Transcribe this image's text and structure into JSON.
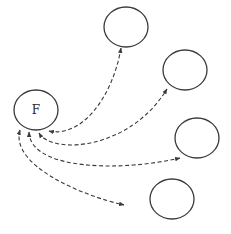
{
  "diagram": {
    "type": "hub-and-spoke",
    "hub": {
      "id": "F",
      "label": "F",
      "cx": 36,
      "cy": 110,
      "rx": 22,
      "ry": 20
    },
    "nodes": [
      {
        "id": "n1",
        "label": "",
        "cx": 126,
        "cy": 27,
        "rx": 22,
        "ry": 20
      },
      {
        "id": "n2",
        "label": "",
        "cx": 185,
        "cy": 70,
        "rx": 22,
        "ry": 20
      },
      {
        "id": "n3",
        "label": "",
        "cx": 197,
        "cy": 138,
        "rx": 22,
        "ry": 20
      },
      {
        "id": "n4",
        "label": "",
        "cx": 172,
        "cy": 199,
        "rx": 22,
        "ry": 20
      }
    ],
    "edges": [
      {
        "from": "F",
        "to": "n1",
        "style": "dashed",
        "direction": "bidirectional"
      },
      {
        "from": "F",
        "to": "n2",
        "style": "dashed",
        "direction": "bidirectional"
      },
      {
        "from": "F",
        "to": "n3",
        "style": "dashed",
        "direction": "bidirectional"
      },
      {
        "from": "F",
        "to": "n4",
        "style": "dashed",
        "direction": "bidirectional"
      }
    ],
    "colors": {
      "stroke": "#3a3a3a",
      "background": "#ffffff"
    }
  }
}
